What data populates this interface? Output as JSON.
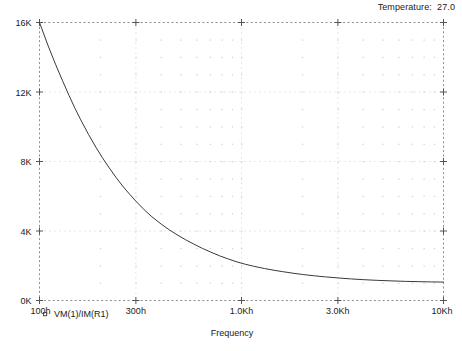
{
  "header": {
    "temperature_label": "Temperature:  27.0"
  },
  "legend": {
    "marker_icon": "square-marker-icon",
    "entries": [
      {
        "label": "VM(1)/IM(R1)",
        "color": "#3a3a3a"
      }
    ]
  },
  "chart_data": {
    "type": "line",
    "title": "",
    "subtitle": "Temperature:  27.0",
    "xlabel": "Frequency",
    "ylabel": "",
    "xscale": "log",
    "yscale": "linear",
    "xlim": [
      100,
      10000
    ],
    "ylim": [
      0,
      16000
    ],
    "grid": true,
    "minor_grid": true,
    "legend_position": "bottom-left",
    "xtick_labels": [
      "100h",
      "300h",
      "1.0Kh",
      "3.0Kh",
      "10Kh"
    ],
    "xtick_values": [
      100,
      300,
      1000,
      3000,
      10000
    ],
    "ytick_labels": [
      "0K",
      "4K",
      "8K",
      "12K",
      "16K"
    ],
    "ytick_values": [
      0,
      4000,
      8000,
      12000,
      16000
    ],
    "series": [
      {
        "name": "VM(1)/IM(R1)",
        "color": "#3a3a3a",
        "x": [
          100,
          110,
          120,
          130,
          140,
          150,
          160,
          175,
          190,
          205,
          220,
          240,
          260,
          280,
          300,
          330,
          360,
          400,
          440,
          480,
          530,
          580,
          640,
          700,
          780,
          860,
          950,
          1050,
          1150,
          1300,
          1450,
          1600,
          1800,
          2000,
          2300,
          2600,
          3000,
          3500,
          4000,
          4700,
          5500,
          6500,
          7500,
          8700,
          10000
        ],
        "y": [
          16000,
          14700,
          13600,
          12650,
          11800,
          11050,
          10400,
          9550,
          8830,
          8210,
          7680,
          7060,
          6540,
          6100,
          5720,
          5220,
          4820,
          4400,
          4060,
          3780,
          3490,
          3250,
          3000,
          2800,
          2570,
          2390,
          2220,
          2080,
          1970,
          1840,
          1740,
          1660,
          1570,
          1500,
          1420,
          1360,
          1300,
          1240,
          1200,
          1160,
          1130,
          1100,
          1085,
          1070,
          1060
        ]
      }
    ]
  }
}
